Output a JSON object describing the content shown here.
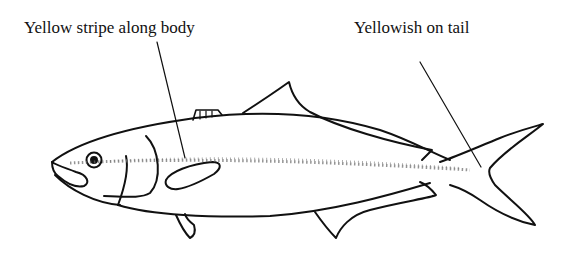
{
  "diagram": {
    "labels": [
      {
        "id": "stripe",
        "text": "Yellow stripe along body"
      },
      {
        "id": "tail",
        "text": "Yellowish on tail"
      }
    ],
    "colors": {
      "ink": "#111111",
      "background": "#ffffff",
      "stipple": "#555555"
    }
  }
}
